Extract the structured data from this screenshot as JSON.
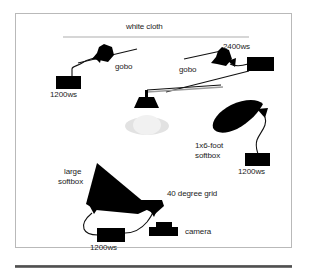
{
  "figure": {
    "type": "lighting-setup-diagram",
    "frame": {
      "border_color": "#b9b9b9",
      "background": "#ffffff"
    },
    "colors": {
      "ink": "#000000",
      "label_text": "#1c1c1c",
      "backdrop_line": "#c9c9c9",
      "light_pool": "#e4e4e4",
      "light_pool_core": "#f2f2f2",
      "rule": "#4d4d4d"
    },
    "labels": {
      "white_cloth": "white cloth",
      "gobo_left": "gobo",
      "power_left": "1200ws",
      "gobo_right": "gobo",
      "power_right": "2400ws",
      "softbox_strip_line1": "1x6-foot",
      "softbox_strip_line2": "softbox",
      "power_strip": "1200ws",
      "softbox_large_line1": "large",
      "softbox_large_line2": "softbox",
      "power_large": "1200ws",
      "grid": "40 degree grid",
      "camera": "camera"
    },
    "elements": [
      {
        "name": "white-cloth-backdrop",
        "kind": "backdrop",
        "label": "white cloth"
      },
      {
        "name": "gobo-light-left",
        "kind": "light-head-with-gobo",
        "label": "gobo",
        "power": "1200ws"
      },
      {
        "name": "gobo-light-right",
        "kind": "light-head-with-gobo",
        "label": "gobo",
        "power": "2400ws"
      },
      {
        "name": "overhead-hair-light",
        "kind": "boom-mounted-head",
        "label": ""
      },
      {
        "name": "subject-light-pool",
        "kind": "subject",
        "label": ""
      },
      {
        "name": "strip-softbox",
        "kind": "softbox",
        "label": "1x6-foot softbox",
        "power": "1200ws"
      },
      {
        "name": "large-softbox",
        "kind": "softbox",
        "label": "large softbox",
        "power": "1200ws"
      },
      {
        "name": "grid-reflector",
        "kind": "reflector-with-grid",
        "label": "40 degree grid"
      },
      {
        "name": "camera",
        "kind": "camera",
        "label": "camera"
      }
    ]
  }
}
